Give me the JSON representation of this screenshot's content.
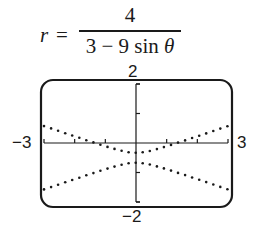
{
  "equation": {
    "lhs": "r",
    "equals": "=",
    "numerator": "4",
    "denominator_text": "3 − 9 sin ",
    "denominator_var": "θ"
  },
  "window_labels": {
    "ymax": "2",
    "ymin": "−2",
    "xmin": "−3",
    "xmax": "3"
  },
  "chart_data": {
    "type": "scatter",
    "xlabel": "",
    "ylabel": "",
    "xlim": [
      -3,
      3
    ],
    "ylim": [
      -2,
      2
    ],
    "grid": false,
    "legend": "none",
    "x_tick_labels": [
      "−3",
      "3"
    ],
    "y_tick_labels": [
      "2",
      "−2"
    ],
    "x_tick_step": 1,
    "y_tick_step": 1,
    "style": "dotted graphing-calculator plot of a hyperbola (eccentricity 3) in polar coordinates",
    "series": [
      {
        "name": "upper branch",
        "x": [
          -3,
          -2,
          -1,
          0,
          1,
          2,
          3
        ],
        "y": [
          -1.57,
          -1.27,
          -0.96,
          -0.67,
          -0.96,
          -1.27,
          -1.57
        ]
      },
      {
        "name": "lower branch",
        "x": [
          -3,
          -2,
          -1,
          0,
          1,
          2,
          3
        ],
        "y": [
          0.57,
          0.27,
          -0.04,
          -0.33,
          -0.04,
          0.27,
          0.57
        ]
      }
    ]
  }
}
